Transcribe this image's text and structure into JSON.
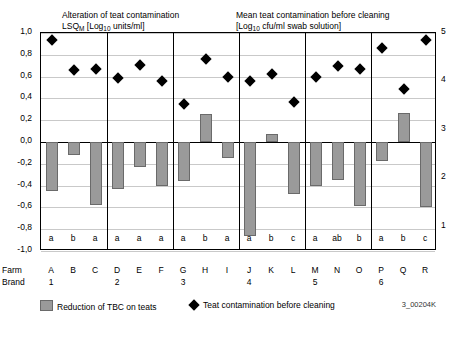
{
  "titles": {
    "left_line1": "Alteration of teat contamination",
    "left_line2": "LSQ_M [Log10 units/ml]",
    "right_line1": "Mean teat contamination before cleaning",
    "right_line2": "[Log10 cfu/ml swab solution]"
  },
  "legend": {
    "bars": "Reduction of TBC on teats",
    "diamonds": "Teat contamination before cleaning",
    "code": "3_00204K"
  },
  "axis_rows": {
    "row_label_farm": "Farm",
    "row_label_brand": "Brand"
  },
  "chart_data": {
    "type": "bar",
    "xlabel": "",
    "ylabel": "LSQ_M [Log10 units/ml]",
    "y2label": "[Log10 cfu/ml swab solution]",
    "ylim": [
      -1.0,
      1.0
    ],
    "y2lim": [
      0.5,
      5.0
    ],
    "yticks": [
      "1,0",
      "0,8",
      "0,6",
      "0,4",
      "0,2",
      "0,0",
      "-0,2",
      "-0,4",
      "-0,6",
      "-0,8",
      "-1,0"
    ],
    "y2ticks": [
      "5",
      "4",
      "3",
      "2",
      "1"
    ],
    "grid": true,
    "categories": [
      "A",
      "B",
      "C",
      "D",
      "E",
      "F",
      "G",
      "H",
      "I",
      "J",
      "K",
      "L",
      "M",
      "N",
      "O",
      "P",
      "Q",
      "R"
    ],
    "group_letters": [
      "a",
      "b",
      "a",
      "a",
      "a",
      "a",
      "a",
      "b",
      "a",
      "a",
      "b",
      "c",
      "a",
      "ab",
      "b",
      "a",
      "b",
      "c"
    ],
    "farm_numbers": [
      "1",
      "",
      "",
      "2",
      "",
      "",
      "3",
      "",
      "",
      "4",
      "",
      "",
      "5",
      "",
      "",
      "6",
      "",
      ""
    ],
    "farm_number_positions": [
      1,
      4,
      7,
      10,
      13,
      16
    ],
    "series": [
      {
        "name": "Reduction of TBC on teats",
        "type": "bar",
        "values": [
          -0.45,
          -0.12,
          -0.58,
          -0.43,
          -0.23,
          -0.4,
          -0.36,
          0.26,
          -0.15,
          -0.86,
          0.07,
          -0.48,
          -0.4,
          -0.35,
          -0.59,
          -0.17,
          0.27,
          -0.6
        ]
      },
      {
        "name": "Teat contamination before cleaning",
        "type": "scatter",
        "values": [
          0.94,
          0.66,
          0.67,
          0.59,
          0.71,
          0.56,
          0.35,
          0.76,
          0.6,
          0.56,
          0.62,
          0.37,
          0.6,
          0.7,
          0.67,
          0.86,
          0.49,
          0.94
        ]
      }
    ],
    "group_separators_after": [
      "C",
      "F",
      "I",
      "L",
      "O"
    ]
  }
}
